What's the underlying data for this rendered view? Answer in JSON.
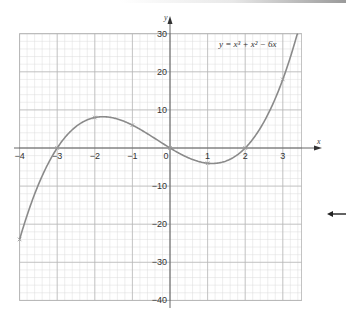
{
  "chart_data": {
    "type": "line",
    "title": "",
    "equation_label": "y = x³ + x² − 6x",
    "xlabel": "x",
    "ylabel": "y",
    "xlim": [
      -4,
      3.5
    ],
    "ylim": [
      -40,
      30
    ],
    "x_ticks": [
      -4,
      -3,
      -2,
      -1,
      0,
      1,
      2,
      3
    ],
    "x_tick_labels": [
      "−4",
      "−3",
      "−2",
      "−1",
      "0",
      "1",
      "2",
      "3"
    ],
    "y_ticks": [
      30,
      20,
      10,
      -10,
      -20,
      -30,
      -40
    ],
    "y_tick_labels": [
      "30",
      "20",
      "10",
      "−10",
      "−20",
      "−30",
      "−40"
    ],
    "grid": true,
    "grid_minor_x": 0.2,
    "grid_minor_y": 2,
    "series": [
      {
        "name": "y = x³ + x² − 6x",
        "x": [
          -4,
          -3,
          -2,
          -1,
          0,
          1,
          2,
          3
        ],
        "values": [
          -24,
          0,
          8,
          6,
          0,
          -4,
          0,
          18
        ],
        "plotted_points": true
      }
    ],
    "colors": {
      "curve": "#8a8a8a",
      "axes": "#555555",
      "grid_major": "#b5b5b5",
      "grid_minor": "#dddddd"
    }
  },
  "side_marker": {
    "icon": "left-arrow-icon"
  }
}
